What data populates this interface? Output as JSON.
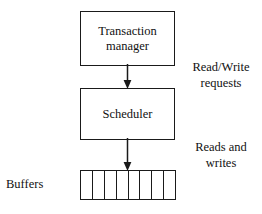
{
  "diagram": {
    "nodes": {
      "transaction_manager": {
        "label": "Transaction\nmanager",
        "shape": "rectangle"
      },
      "scheduler": {
        "label": "Scheduler",
        "shape": "rectangle"
      },
      "buffers": {
        "label": "Buffers",
        "shape": "segmented-rectangle",
        "cell_count": 8,
        "cells": [
          "",
          "",
          "",
          "",
          "",
          "",
          "",
          ""
        ]
      }
    },
    "edges": [
      {
        "from": "transaction_manager",
        "to": "scheduler",
        "direction": "down",
        "arrowhead": "filled-triangle",
        "label": "Read/Write\nrequests"
      },
      {
        "from": "scheduler",
        "to": "buffers",
        "direction": "down",
        "arrowhead": "filled-triangle",
        "label": "Reads and\nwrites"
      }
    ],
    "labels": {
      "read_write_requests": "Read/Write\nrequests",
      "reads_and_writes": "Reads and\nwrites",
      "buffers": "Buffers"
    },
    "colors": {
      "stroke": "#1a1a1a",
      "text": "#111111",
      "background": "#ffffff"
    }
  }
}
